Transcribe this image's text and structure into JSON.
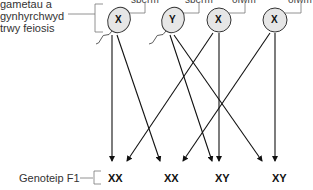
{
  "left_label": [
    "gametau a",
    "gynhyrchwyd",
    "trwy feiosis"
  ],
  "gametes": [
    {
      "type": "sperm",
      "label": "sberm",
      "chromosome": "X"
    },
    {
      "type": "sperm",
      "label": "sberm",
      "chromosome": "Y"
    },
    {
      "type": "egg",
      "label": "ofwm",
      "chromosome": "X"
    },
    {
      "type": "egg",
      "label": "ofwm",
      "chromosome": "X"
    }
  ],
  "f1_label": "Genoteip F1",
  "f1_genotypes": [
    "XX",
    "XX",
    "XY",
    "XY"
  ],
  "colors": {
    "cell_fill": "#e6e6e6",
    "line": "#222222"
  }
}
